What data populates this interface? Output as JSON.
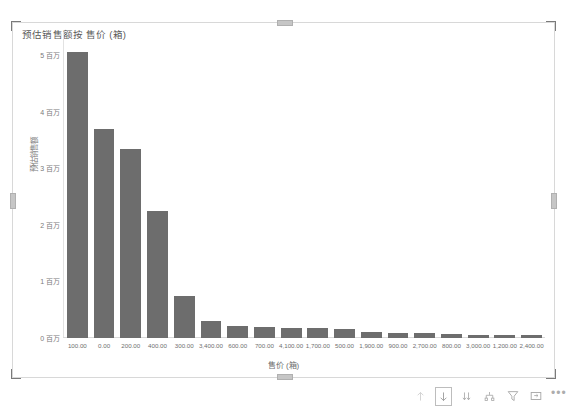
{
  "visual": {
    "title": "预估销售额按 售价 (箱)",
    "bar_color": "#6d6d6d",
    "axis_text_color": "#7a7a7a",
    "selection_frame_color": "#7a7a7a"
  },
  "chart_data": {
    "type": "bar",
    "title": "预估销售额按 售价 (箱)",
    "xlabel": "售价 (箱)",
    "ylabel": "预估销售额",
    "ylim": [
      0,
      5200000
    ],
    "grid": false,
    "legend": false,
    "y_ticks": [
      {
        "value": 5000000,
        "label": "5 百万"
      },
      {
        "value": 4000000,
        "label": "4 百万"
      },
      {
        "value": 3000000,
        "label": "3 百万"
      },
      {
        "value": 2000000,
        "label": "2 百万"
      },
      {
        "value": 1000000,
        "label": "1 百万"
      },
      {
        "value": 0,
        "label": "0 百万"
      }
    ],
    "categories": [
      "100.00",
      "0.00",
      "200.00",
      "400.00",
      "300.00",
      "3,400.00",
      "600.00",
      "700.00",
      "4,100.00",
      "1,700.00",
      "500.00",
      "1,900.00",
      "900.00",
      "2,700.00",
      "800.00",
      "3,000.00",
      "1,200.00",
      "2,400.00"
    ],
    "values": [
      5050000,
      3700000,
      3350000,
      2250000,
      740000,
      300000,
      215000,
      190000,
      185000,
      175000,
      160000,
      110000,
      90000,
      80000,
      70000,
      62000,
      55000,
      48000
    ]
  },
  "toolbar": {
    "items": [
      {
        "name": "drill-up-icon",
        "label": "向上钻取",
        "selected": false,
        "enabled": false
      },
      {
        "name": "drill-down-icon",
        "label": "向下钻取",
        "selected": true,
        "enabled": true
      },
      {
        "name": "expand-all-icon",
        "label": "展开到下一级",
        "selected": false,
        "enabled": true
      },
      {
        "name": "drill-hierarchy-icon",
        "label": "钻取层次结构",
        "selected": false,
        "enabled": true
      },
      {
        "name": "filter-icon",
        "label": "筛选器",
        "selected": false,
        "enabled": true
      },
      {
        "name": "focus-mode-icon",
        "label": "聚焦模式",
        "selected": false,
        "enabled": true
      },
      {
        "name": "more-options-icon",
        "label": "更多选项",
        "selected": false,
        "enabled": true
      }
    ],
    "more_glyph": "•••"
  }
}
